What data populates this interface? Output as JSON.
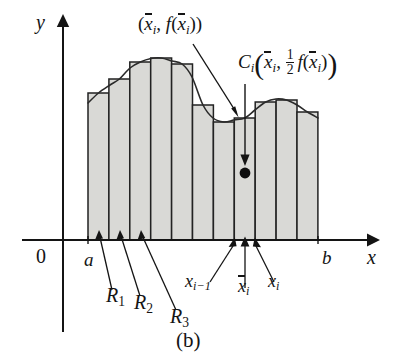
{
  "figure": {
    "caption": "(b)",
    "type": "calculus-riemann-midpoint-rectangles"
  },
  "axes": {
    "x_label": "x",
    "y_label": "y",
    "origin_label": "0",
    "a_label": "a",
    "b_label": "b"
  },
  "labels": {
    "point_on_curve": {
      "open_paren": "(",
      "x_sym": "x",
      "x_sub": "i",
      "comma": ", ",
      "f": "f",
      "f_open": "(",
      "fx_sym": "x",
      "fx_sub": "i",
      "f_close": ")",
      "close_paren": ")",
      "plain": "(x̄i, f(x̄i))"
    },
    "centroid": {
      "c_sym": "C",
      "c_sub": "i",
      "open_paren": "(",
      "x_sym": "x",
      "x_sub": "i",
      "comma": ", ",
      "frac_num": "1",
      "frac_den": "2",
      "f": "f",
      "f_open": "(",
      "fx_sym": "x",
      "fx_sub": "i",
      "f_close": ")",
      "close_paren": ")",
      "plain": "Ci(x̄i, 1/2 f(x̄i))"
    },
    "regions": [
      {
        "sym": "R",
        "sub": "1",
        "plain": "R1"
      },
      {
        "sym": "R",
        "sub": "2",
        "plain": "R2"
      },
      {
        "sym": "R",
        "sub": "3",
        "plain": "R3"
      }
    ],
    "partition": {
      "x_prev_sym": "x",
      "x_prev_sub": "i−1",
      "x_prev_plain": "xi−1",
      "x_mid_sym": "x",
      "x_mid_sub": "i",
      "x_mid_plain": "x̄i",
      "x_next_sym": "x",
      "x_next_sub": "i",
      "x_next_plain": "xi"
    }
  },
  "colors": {
    "stroke": "#141414",
    "rect_fill": "#d9d9d6",
    "rect_stroke": "#222222",
    "curve": "#2a2a2a",
    "dot": "#0d0d0d",
    "background": "#ffffff"
  },
  "chart_data": {
    "type": "area",
    "title": "",
    "xlabel": "x",
    "ylabel": "y",
    "grid": false,
    "legend": null,
    "axis": {
      "baseline_y_px": 240,
      "x_axis_start_px": 22,
      "x_axis_end_px": 375,
      "y_axis_x_px": 63,
      "y_axis_top_px": 16,
      "domain_start_px": 88,
      "domain_end_px": 318
    },
    "n_rectangles": 11,
    "rect_width_px": 20.9,
    "rect_left_edges_px": [
      88.0,
      108.9,
      129.8,
      150.7,
      171.6,
      192.5,
      213.4,
      234.3,
      255.2,
      276.1,
      297.0
    ],
    "rect_midpoints_px": [
      98.5,
      119.4,
      140.3,
      161.2,
      182.1,
      203.0,
      223.9,
      244.8,
      265.7,
      286.6,
      307.5
    ],
    "rect_top_y_px": [
      93,
      79,
      62,
      58,
      64,
      105,
      122,
      118,
      102,
      100,
      112
    ],
    "rect_heights_px": [
      147,
      161,
      178,
      182,
      176,
      135,
      118,
      122,
      138,
      140,
      128
    ],
    "curve_points_px": [
      [
        88,
        103
      ],
      [
        98.5,
        93
      ],
      [
        110,
        85
      ],
      [
        119.4,
        79
      ],
      [
        130,
        68
      ],
      [
        140.3,
        62
      ],
      [
        151,
        58.5
      ],
      [
        161.2,
        58
      ],
      [
        172,
        61
      ],
      [
        182.1,
        64
      ],
      [
        192,
        77
      ],
      [
        203.0,
        105
      ],
      [
        213,
        118
      ],
      [
        223.9,
        122
      ],
      [
        234,
        120
      ],
      [
        244.8,
        118
      ],
      [
        255,
        110
      ],
      [
        265.7,
        102
      ],
      [
        276,
        99
      ],
      [
        286.6,
        100
      ],
      [
        297,
        105
      ],
      [
        307.5,
        112
      ],
      [
        318,
        118
      ]
    ],
    "highlighted_index": 8,
    "highlighted_rect": {
      "left_px": 234.3,
      "right_px": 255.2,
      "midpoint_px": 244.8,
      "top_px": 118,
      "baseline_px": 240,
      "centroid_dot_px": [
        244.8,
        172
      ]
    }
  }
}
